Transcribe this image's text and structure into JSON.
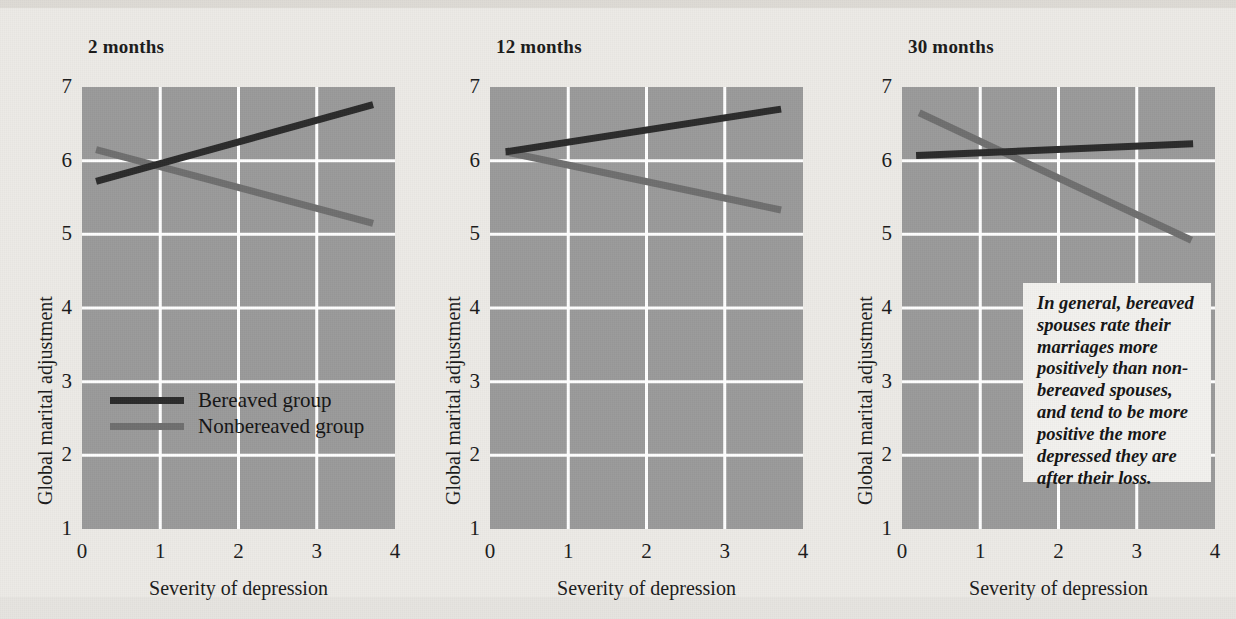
{
  "figure": {
    "background_color": "#eceae6",
    "plot_fill_color": "#9a9a9a",
    "gridline_color": "#ffffff",
    "series_colors": {
      "bereaved": "#2b2b2b",
      "nonbereaved": "#6e6e6e"
    },
    "axis_title_x": "Severity of depression",
    "axis_title_y": "Global marital adjustment",
    "credit": ""
  },
  "legend": {
    "position": "panel-1-inside-lower-left",
    "entries": [
      {
        "label": "Bereaved group",
        "color": "#2b2b2b"
      },
      {
        "label": "Nonbereaved group",
        "color": "#6e6e6e"
      }
    ]
  },
  "callout": {
    "text": "In general, bereaved spouses rate their marriages more positively than non-bereaved spouses, and tend to be more positive the more depressed they are after their loss."
  },
  "chart_data": [
    {
      "type": "line",
      "title": "2 months",
      "xlabel": "Severity of depression",
      "ylabel": "Global marital adjustment",
      "xlim": [
        0,
        4
      ],
      "ylim": [
        1,
        7
      ],
      "xticks": [
        "0",
        "1",
        "2",
        "3",
        "4"
      ],
      "yticks": [
        "1",
        "2",
        "3",
        "4",
        "5",
        "6",
        "7"
      ],
      "grid": true,
      "series": [
        {
          "name": "Bereaved group",
          "color": "#2b2b2b",
          "x": [
            0.18,
            3.72
          ],
          "y": [
            5.72,
            6.76
          ]
        },
        {
          "name": "Nonbereaved group",
          "color": "#6e6e6e",
          "x": [
            0.18,
            3.72
          ],
          "y": [
            6.15,
            5.15
          ]
        }
      ]
    },
    {
      "type": "line",
      "title": "12 months",
      "xlabel": "Severity of depression",
      "ylabel": "Global marital adjustment",
      "xlim": [
        0,
        4
      ],
      "ylim": [
        1,
        7
      ],
      "xticks": [
        "0",
        "1",
        "2",
        "3",
        "4"
      ],
      "yticks": [
        "1",
        "2",
        "3",
        "4",
        "5",
        "6",
        "7"
      ],
      "grid": true,
      "series": [
        {
          "name": "Bereaved group",
          "color": "#2b2b2b",
          "x": [
            0.2,
            3.72
          ],
          "y": [
            6.12,
            6.7
          ]
        },
        {
          "name": "Nonbereaved group",
          "color": "#6e6e6e",
          "x": [
            0.2,
            3.72
          ],
          "y": [
            6.12,
            5.33
          ]
        }
      ]
    },
    {
      "type": "line",
      "title": "30 months",
      "xlabel": "Severity of depression",
      "ylabel": "Global marital adjustment",
      "xlim": [
        0,
        4
      ],
      "ylim": [
        1,
        7
      ],
      "xticks": [
        "0",
        "1",
        "2",
        "3",
        "4"
      ],
      "yticks": [
        "1",
        "2",
        "3",
        "4",
        "5",
        "6",
        "7"
      ],
      "grid": true,
      "series": [
        {
          "name": "Bereaved group",
          "color": "#2b2b2b",
          "x": [
            0.18,
            3.72
          ],
          "y": [
            6.07,
            6.23
          ]
        },
        {
          "name": "Nonbereaved group",
          "color": "#6e6e6e",
          "x": [
            0.22,
            3.7
          ],
          "y": [
            6.65,
            4.92
          ]
        }
      ]
    }
  ],
  "panels_layout": [
    {
      "left": 82,
      "top": 87,
      "width": 313,
      "height": 442,
      "title_left": 88,
      "title_top": 36
    },
    {
      "left": 490,
      "top": 87,
      "width": 313,
      "height": 442,
      "title_left": 496,
      "title_top": 36
    },
    {
      "left": 902,
      "top": 87,
      "width": 313,
      "height": 442,
      "title_left": 908,
      "title_top": 36
    }
  ]
}
